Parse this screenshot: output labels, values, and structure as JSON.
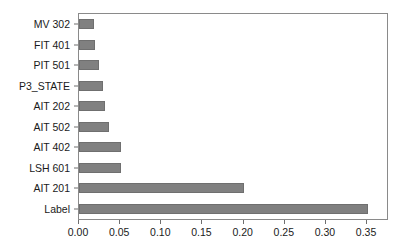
{
  "chart_data": {
    "type": "bar",
    "orientation": "horizontal",
    "title": "",
    "subtitle": "",
    "xlabel": "",
    "ylabel": "",
    "categories": [
      "Label",
      "AIT 201",
      "LSH 601",
      "AIT 402",
      "AIT 502",
      "AIT 202",
      "P3_STATE",
      "PIT 501",
      "FIT 401",
      "MV 302"
    ],
    "values": [
      0.351,
      0.2,
      0.051,
      0.051,
      0.036,
      0.031,
      0.029,
      0.024,
      0.02,
      0.018
    ],
    "xlim": [
      0.0,
      0.3742
    ],
    "xticks": [
      0.0,
      0.05,
      0.1,
      0.15,
      0.2,
      0.25,
      0.3,
      0.35
    ],
    "xticklabels": [
      "0.00",
      "0.05",
      "0.10",
      "0.15",
      "0.20",
      "0.25",
      "0.30",
      "0.35"
    ],
    "grid": false,
    "legend": false,
    "bar_color": "#808080",
    "bar_edge_color": "#6f6f6f",
    "frame_color": "#8a8a8a",
    "text_color": "#1a1a1a"
  }
}
